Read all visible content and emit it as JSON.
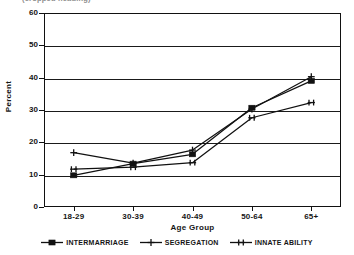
{
  "title": {
    "text": "(cropped heading)",
    "visible_fragment": true
  },
  "axes": {
    "y_title": "Percent",
    "x_title": "Age Group",
    "y_ticks": [
      0,
      10,
      20,
      30,
      40,
      50,
      60
    ],
    "x_ticks": [
      "18-29",
      "30-39",
      "40-49",
      "50-64",
      "65+"
    ]
  },
  "legend": {
    "items": [
      {
        "label": "INTERMARRIAGE",
        "marker": "filled-square-marker"
      },
      {
        "label": "SEGREGATION",
        "marker": "plus-marker"
      },
      {
        "label": "INNATE ABILITY",
        "marker": "asterisk-marker"
      }
    ]
  },
  "chart_data": {
    "type": "line",
    "title": "",
    "xlabel": "Age Group",
    "ylabel": "Percent",
    "categories": [
      "18-29",
      "30-39",
      "40-49",
      "50-64",
      "65+"
    ],
    "ylim": [
      0,
      60
    ],
    "yticks": [
      0,
      10,
      20,
      30,
      40,
      50,
      60
    ],
    "grid": "horizontal",
    "legend_position": "bottom",
    "color": "#111111",
    "series": [
      {
        "name": "INTERMARRIAGE",
        "marker": "filled-square",
        "values": [
          9.8,
          13.4,
          16.3,
          30.7,
          39.0
        ]
      },
      {
        "name": "SEGREGATION",
        "marker": "plus",
        "values": [
          16.8,
          13.6,
          17.6,
          30.3,
          40.3
        ]
      },
      {
        "name": "INNATE ABILITY",
        "marker": "asterisk",
        "values": [
          11.7,
          12.3,
          13.7,
          27.6,
          32.3
        ]
      }
    ]
  }
}
